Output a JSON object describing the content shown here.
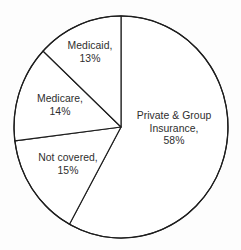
{
  "chart_data": {
    "type": "pie",
    "title": "",
    "subtitle": "",
    "xlabel": "",
    "ylabel": "",
    "legend": "none",
    "grid": false,
    "units": "percent",
    "start_angle_deg": 0,
    "direction": "clockwise",
    "categories": [
      "Private & Group Insurance",
      "Not covered",
      "Medicare",
      "Medicaid"
    ],
    "values": [
      58,
      15,
      14,
      13
    ],
    "slices": [
      {
        "name": "Private & Group Insurance",
        "value": 58,
        "value_label": "58%",
        "label_lines": [
          "Private & Group",
          "Insurance,",
          "58%"
        ],
        "color": "#ffffff",
        "outline": "#1d1d1d"
      },
      {
        "name": "Not covered",
        "value": 15,
        "value_label": "15%",
        "label_lines": [
          "Not covered,",
          "15%"
        ],
        "color": "#ffffff",
        "outline": "#1d1d1d"
      },
      {
        "name": "Medicare",
        "value": 14,
        "value_label": "14%",
        "label_lines": [
          "Medicare,",
          "14%"
        ],
        "color": "#ffffff",
        "outline": "#1d1d1d"
      },
      {
        "name": "Medicaid",
        "value": 13,
        "value_label": "13%",
        "label_lines": [
          "Medicaid,",
          "13%"
        ],
        "color": "#ffffff",
        "outline": "#1d1d1d"
      }
    ]
  },
  "labels": {
    "private": {
      "line1": "Private & Group",
      "line2": "Insurance,",
      "line3": "58%"
    },
    "medicaid": {
      "line1": "Medicaid,",
      "line2": "13%"
    },
    "medicare": {
      "line1": "Medicare,",
      "line2": "14%"
    },
    "not_covered": {
      "line1": "Not covered,",
      "line2": "15%"
    }
  },
  "style": {
    "background": "#fdfdfd",
    "stroke": "#1d1d1d",
    "fill": "#ffffff",
    "text": "#2e2e2e"
  },
  "geometry": {
    "center_x": 121,
    "center_y": 127,
    "radius_x": 107,
    "radius_y": 111
  }
}
